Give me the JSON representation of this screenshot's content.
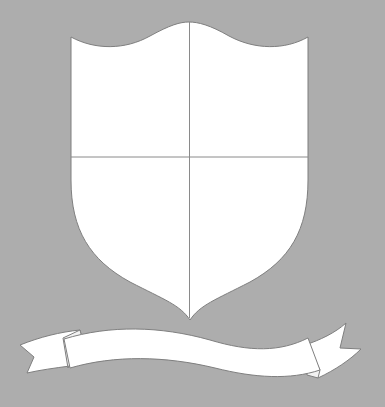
{
  "image": {
    "description": "Blank heraldic shield template divided into four quarters, with an empty banner ribbon below",
    "width": 385,
    "height": 407
  },
  "colors": {
    "background": "#adadad",
    "fill": "#ffffff",
    "outline": "#7f7f7f",
    "divider": "#8a8a8a"
  },
  "shield": {
    "label": "",
    "quarters": [
      "",
      "",
      "",
      ""
    ]
  },
  "banner": {
    "text": ""
  }
}
